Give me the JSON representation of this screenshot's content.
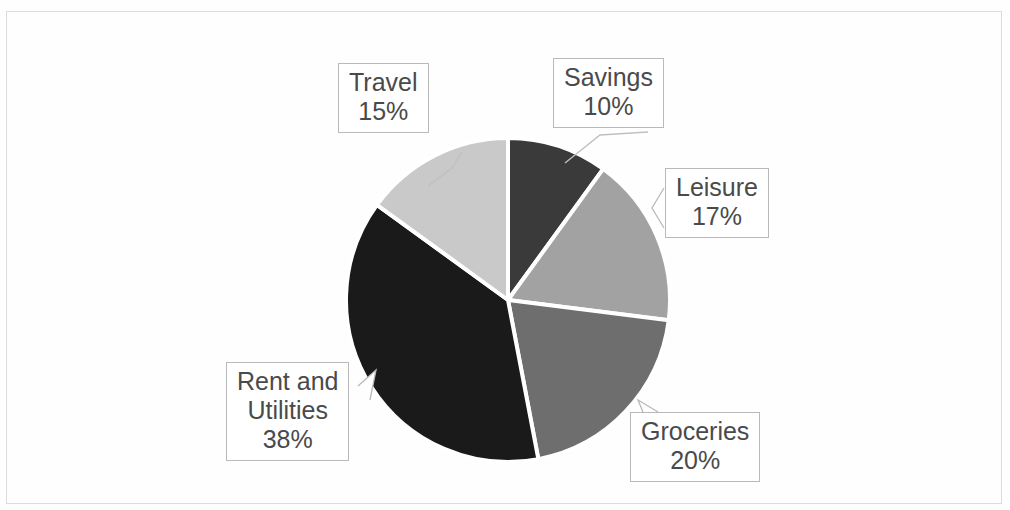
{
  "chart_data": {
    "type": "pie",
    "title": "",
    "categories": [
      "Savings",
      "Leisure",
      "Groceries",
      "Rent and Utilities",
      "Travel"
    ],
    "values": [
      10,
      17,
      20,
      38,
      15
    ],
    "value_unit": "%",
    "slice_colors": [
      "#3a3a3a",
      "#a2a2a2",
      "#6e6e6e",
      "#1a1a1a",
      "#c9c9c9"
    ],
    "start_angle_deg": 0,
    "direction": "clockwise",
    "legend": "none",
    "data_labels": "category and percentage shown in callout boxes",
    "grid": false,
    "geometry": {
      "center_x": 508,
      "center_y": 300,
      "radius": 162
    },
    "slices": [
      {
        "name": "Savings",
        "percent": 10,
        "label_line1": "Savings",
        "label_line2": "10%",
        "label_line3": "",
        "color": "#3a3a3a"
      },
      {
        "name": "Leisure",
        "percent": 17,
        "label_line1": "Leisure",
        "label_line2": "17%",
        "label_line3": "",
        "color": "#a2a2a2"
      },
      {
        "name": "Groceries",
        "percent": 20,
        "label_line1": "Groceries",
        "label_line2": "20%",
        "label_line3": "",
        "color": "#6e6e6e"
      },
      {
        "name": "Rent and Utilities",
        "percent": 38,
        "label_line1": "Rent and",
        "label_line2": "Utilities",
        "label_line3": "38%",
        "color": "#1a1a1a"
      },
      {
        "name": "Travel",
        "percent": 15,
        "label_line1": "Travel",
        "label_line2": "15%",
        "label_line3": "",
        "color": "#c9c9c9"
      }
    ]
  },
  "page": {
    "background_color": "#fefefe",
    "frame_color": "#dcdcdc",
    "label_text_color": "#4a4a4a",
    "label_border_color": "#b9b9b9",
    "slice_separator_color": "#ffffff",
    "top_edge_sliver": ""
  }
}
